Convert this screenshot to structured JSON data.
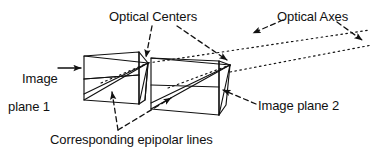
{
  "figure": {
    "kind": "epipolar-geometry-diagram",
    "background_color": "#ffffff",
    "ink_color": "#111111",
    "labels": {
      "optical_centers": "Optical Centers",
      "optical_axes": "Optical Axes",
      "image_plane_1_line1": "Image",
      "image_plane_1_line2": "plane 1",
      "image_plane_2": "Image plane 2",
      "corresponding_epipolar_lines": "Corresponding epipolar lines"
    },
    "parts": {
      "frustum_1": "left camera frustum / image plane 1",
      "frustum_2": "right camera frustum / image plane 2",
      "optical_center_1": "apex of left frustum",
      "optical_center_2": "apex of right frustum",
      "epipolar_line_1": "diagonal line across image plane 1",
      "epipolar_line_2": "diagonal line across image plane 2",
      "optical_axis_1": "dotted ray leaving optical center 1",
      "optical_axis_2": "dotted ray leaving optical center 2"
    }
  }
}
